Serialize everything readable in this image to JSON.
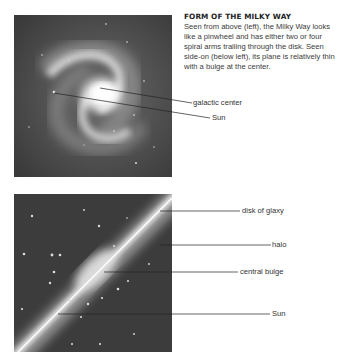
{
  "caption": {
    "title": "FORM OF THE MILKY WAY",
    "body": "Seen from above (left), the Milky Way looks like a pinwheel and has either two or four spiral arms trailing through the disk. Seen side-on (below left), its plane is relatively thin with a bulge at the center."
  },
  "top_view": {
    "labels": {
      "galactic_center": "galactic center",
      "sun": "Sun"
    }
  },
  "side_view": {
    "labels": {
      "disk": "disk of glaxy",
      "halo": "halo",
      "central_bulge": "central bulge",
      "sun": "Sun"
    }
  },
  "colors": {
    "space": "#3e3e3e",
    "glow": "#f4f4f4",
    "text": "#333333",
    "leader": "#222222"
  }
}
